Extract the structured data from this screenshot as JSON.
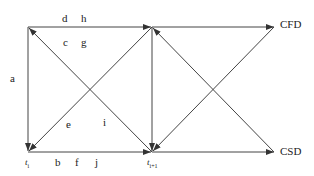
{
  "nodes": {
    "cfd": "CFD",
    "csd": "CSD",
    "t_i": "t",
    "t_i_sub": "i",
    "t_i1": "t",
    "t_i1_sub": "i+1"
  },
  "labels": {
    "a": "a",
    "b": "b",
    "c": "c",
    "d": "d",
    "e": "e",
    "f": "f",
    "g": "g",
    "h": "h",
    "i": "i",
    "j": "j"
  },
  "colors": {
    "line": "#333333",
    "background": "#ffffff"
  }
}
